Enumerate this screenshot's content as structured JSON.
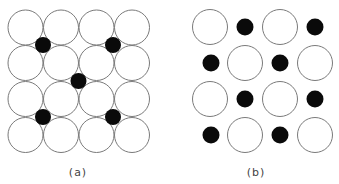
{
  "figure": {
    "panels": [
      {
        "id": "a",
        "label": "(a)",
        "label_pos": [
          78,
          166
        ],
        "large_radius": 17.5,
        "small_radius": 8,
        "large_circles": [
          [
            25.5,
            27.5
          ],
          [
            61,
            27.5
          ],
          [
            96.5,
            27.5
          ],
          [
            132,
            27.5
          ],
          [
            25.5,
            63
          ],
          [
            61,
            63
          ],
          [
            96.5,
            63
          ],
          [
            132,
            63
          ],
          [
            25.5,
            99
          ],
          [
            61,
            99
          ],
          [
            96.5,
            99
          ],
          [
            132,
            99
          ],
          [
            25.5,
            135
          ],
          [
            61,
            135
          ],
          [
            96.5,
            135
          ],
          [
            132,
            135
          ]
        ],
        "small_circles": [
          [
            43,
            45
          ],
          [
            113,
            45
          ],
          [
            78.5,
            81
          ],
          [
            43,
            117
          ],
          [
            113,
            117
          ]
        ]
      },
      {
        "id": "b",
        "label": "(b)",
        "label_pos": [
          256,
          166
        ],
        "large_radius": 17.5,
        "small_radius": 8.5,
        "large_circles": [
          [
            210,
            27
          ],
          [
            280,
            27
          ],
          [
            245,
            63
          ],
          [
            315,
            63
          ],
          [
            210,
            99
          ],
          [
            280,
            99
          ],
          [
            245,
            135
          ],
          [
            315,
            135
          ]
        ],
        "small_circles": [
          [
            245,
            27
          ],
          [
            315,
            27
          ],
          [
            211,
            63
          ],
          [
            280,
            63
          ],
          [
            245,
            99
          ],
          [
            315,
            99
          ],
          [
            211,
            135
          ],
          [
            280,
            135
          ]
        ]
      }
    ],
    "colors": {
      "large_stroke": "#7a7a7a",
      "large_fill": "#ffffff",
      "small_fill": "#0a0a0a",
      "label": "#444444"
    }
  }
}
